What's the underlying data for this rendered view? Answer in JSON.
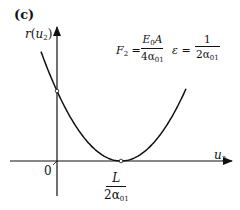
{
  "panel_label": "(c)",
  "axes": {
    "y_label_fn": "r",
    "y_label_arg": "u",
    "y_label_sub": "2",
    "x_label_var": "u",
    "x_label_sub": "2",
    "origin_label": "0"
  },
  "minimum_label": {
    "numerator": "L",
    "denominator_var": "2α",
    "denominator_sub": "01"
  },
  "formulas": {
    "F_symbol": "F",
    "F_sub": "2",
    "equals": "=",
    "F_numerator_var": "E",
    "F_numerator_sub": "0",
    "F_numerator_rest": "A",
    "F_denominator_var": "4α",
    "F_denominator_sub": "01",
    "eps_symbol": "ε",
    "eps_numerator": "1",
    "eps_denominator_var": "2α",
    "eps_denominator_sub": "01"
  },
  "curve": {
    "type": "parabola",
    "description": "r(u2) quadratic in u2 with minimum 0 at u2 = L/(2α01)",
    "vertex_u": "L/(2α01)",
    "vertex_r": 0
  }
}
